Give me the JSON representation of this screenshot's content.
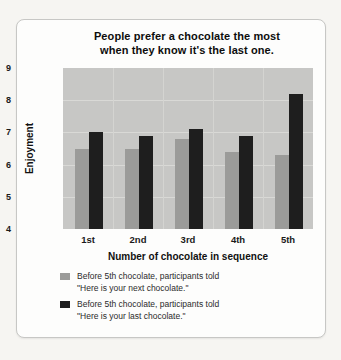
{
  "card": {
    "background": "#fdfdfc",
    "border_color": "#c7c7c5"
  },
  "chart_data": {
    "type": "bar",
    "title_line1": "People prefer a chocolate the most",
    "title_line2": "when they know it's the last one.",
    "title": "People prefer a chocolate the most when they know it's the last one.",
    "categories": [
      "1st",
      "2nd",
      "3rd",
      "4th",
      "5th"
    ],
    "series": [
      {
        "name": "Before 5th chocolate, participants told \"Here is your next chocolate.\"",
        "color": "#9b9b99",
        "values": [
          6.5,
          6.5,
          6.8,
          6.4,
          6.3
        ]
      },
      {
        "name": "Before 5th chocolate, participants told \"Here is your last chocolate.\"",
        "color": "#1e1e1e",
        "values": [
          7.0,
          6.9,
          7.1,
          6.9,
          8.2
        ]
      }
    ],
    "xlabel": "Number of chocolate in sequence",
    "ylabel": "Enjoyment",
    "ylim": [
      4,
      9
    ],
    "yticks": [
      4,
      5,
      6,
      7,
      8,
      9
    ],
    "grid": true,
    "legend_position": "bottom",
    "plot_background": "#c7c7c5",
    "gridline_color": "#d9d9d6"
  },
  "legend": {
    "items": [
      {
        "color": "#9b9b99",
        "line1": "Before 5th chocolate, participants told",
        "line2": "\"Here is your next chocolate.\""
      },
      {
        "color": "#1e1e1e",
        "line1": "Before 5th chocolate, participants told",
        "line2": "\"Here is your last chocolate.\""
      }
    ]
  }
}
